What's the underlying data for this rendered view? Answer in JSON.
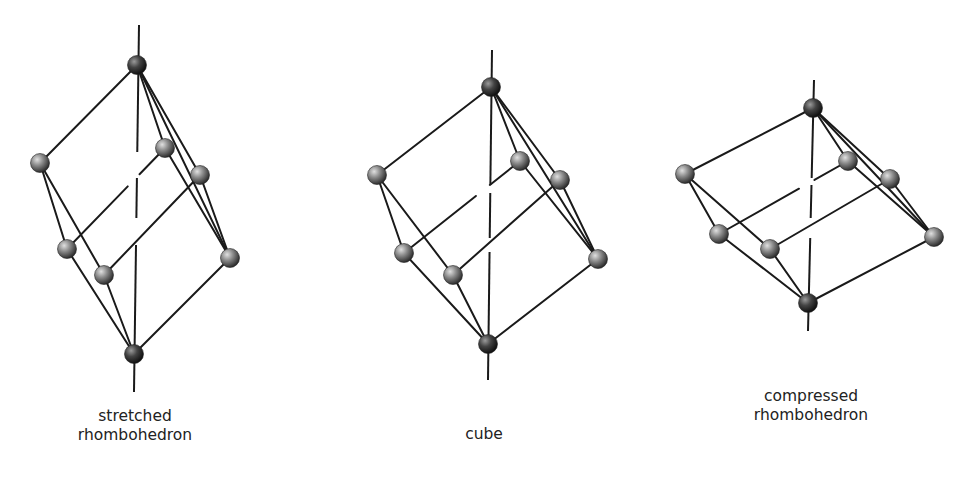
{
  "figures": [
    {
      "id": "stretched",
      "label_lines": [
        "stretched",
        "rhombohedron"
      ],
      "label_pos": [
        135,
        407
      ],
      "axis": [
        [
          139,
          25
        ],
        [
          134,
          392
        ]
      ],
      "axis_gaps": [
        [
          152,
          178
        ],
        [
          218,
          245
        ]
      ],
      "atoms": {
        "top": [
          137,
          65
        ],
        "left": [
          40,
          163
        ],
        "back": [
          165,
          148
        ],
        "right_up": [
          200,
          175
        ],
        "low_left": [
          67,
          249
        ],
        "low_mid": [
          104,
          275
        ],
        "right_low": [
          230,
          258
        ],
        "bottom": [
          134,
          354
        ]
      }
    },
    {
      "id": "cube",
      "label_lines": [
        "cube"
      ],
      "label_pos": [
        484,
        425
      ],
      "axis": [
        [
          492,
          50
        ],
        [
          488,
          380
        ]
      ],
      "axis_gaps": [
        [
          185,
          193
        ],
        [
          238,
          252
        ]
      ],
      "atoms": {
        "top": [
          491,
          87
        ],
        "left": [
          377,
          175
        ],
        "back": [
          520,
          161
        ],
        "right_up": [
          560,
          180
        ],
        "low_left": [
          404,
          253
        ],
        "low_mid": [
          453,
          275
        ],
        "right_low": [
          598,
          259
        ],
        "bottom": [
          488,
          344
        ]
      }
    },
    {
      "id": "compressed",
      "label_lines": [
        "compressed",
        "rhombohedron"
      ],
      "label_pos": [
        811,
        387
      ],
      "axis": [
        [
          814,
          80
        ],
        [
          808,
          331
        ]
      ],
      "axis_gaps": [
        [
          178,
          185
        ],
        [
          218,
          238
        ]
      ],
      "atoms": {
        "top": [
          813,
          108
        ],
        "left": [
          685,
          174
        ],
        "back": [
          848,
          161
        ],
        "right_up": [
          890,
          179
        ],
        "low_left": [
          719,
          234
        ],
        "low_mid": [
          770,
          249
        ],
        "right_low": [
          934,
          237
        ],
        "bottom": [
          808,
          303
        ]
      }
    }
  ],
  "colors": {
    "edge": "#1a1a1a",
    "atom_light": "#c8c8c8",
    "atom_mid": "#7a7a7a",
    "atom_dark": "#2e2e2e",
    "pole_atom_dark": "#111111"
  }
}
